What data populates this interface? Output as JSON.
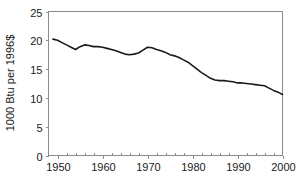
{
  "chart_data": {
    "type": "line",
    "title": "",
    "subtitle": "",
    "xlabel": "",
    "ylabel": "1000 Btu per 1996$",
    "xlim": [
      1948,
      2000
    ],
    "ylim": [
      0,
      25
    ],
    "grid": false,
    "legend": null,
    "legend_position": "none",
    "x_ticks": [
      1950,
      1960,
      1970,
      1980,
      1990,
      2000
    ],
    "x_tick_labels": [
      "1950",
      "1960",
      "1970",
      "1980",
      "1990",
      "2000"
    ],
    "x_minor_tick_interval": 2,
    "y_ticks": [
      0,
      5,
      10,
      15,
      20,
      25
    ],
    "y_tick_labels": [
      "0",
      "5",
      "10",
      "15",
      "20",
      "25"
    ],
    "line_color": "#1a1a1a",
    "frame_color": "#8c8c8c",
    "background_color": "#ffffff",
    "x": [
      1949,
      1950,
      1951,
      1952,
      1953,
      1954,
      1955,
      1956,
      1957,
      1958,
      1959,
      1960,
      1961,
      1962,
      1963,
      1964,
      1965,
      1966,
      1967,
      1968,
      1969,
      1970,
      1971,
      1972,
      1973,
      1974,
      1975,
      1976,
      1977,
      1978,
      1979,
      1980,
      1981,
      1982,
      1983,
      1984,
      1985,
      1986,
      1987,
      1988,
      1989,
      1990,
      1991,
      1992,
      1993,
      1994,
      1995,
      1996,
      1997,
      1998,
      1999,
      2000
    ],
    "values": [
      20.2,
      20.0,
      19.6,
      19.2,
      18.8,
      18.4,
      18.9,
      19.2,
      19.1,
      18.9,
      18.9,
      18.8,
      18.6,
      18.4,
      18.2,
      17.9,
      17.6,
      17.5,
      17.6,
      17.8,
      18.3,
      18.8,
      18.7,
      18.4,
      18.2,
      17.9,
      17.5,
      17.3,
      17.0,
      16.6,
      16.2,
      15.6,
      15.0,
      14.4,
      13.9,
      13.4,
      13.1,
      13.0,
      13.0,
      12.9,
      12.8,
      12.6,
      12.6,
      12.5,
      12.4,
      12.3,
      12.2,
      12.1,
      11.7,
      11.3,
      11.0,
      10.6
    ],
    "series": [
      {
        "name": "Energy intensity",
        "values": [
          20.2,
          20.0,
          19.6,
          19.2,
          18.8,
          18.4,
          18.9,
          19.2,
          19.1,
          18.9,
          18.9,
          18.8,
          18.6,
          18.4,
          18.2,
          17.9,
          17.6,
          17.5,
          17.6,
          17.8,
          18.3,
          18.8,
          18.7,
          18.4,
          18.2,
          17.9,
          17.5,
          17.3,
          17.0,
          16.6,
          16.2,
          15.6,
          15.0,
          14.4,
          13.9,
          13.4,
          13.1,
          13.0,
          13.0,
          12.9,
          12.8,
          12.6,
          12.6,
          12.5,
          12.4,
          12.3,
          12.2,
          12.1,
          11.7,
          11.3,
          11.0,
          10.6
        ]
      }
    ]
  }
}
